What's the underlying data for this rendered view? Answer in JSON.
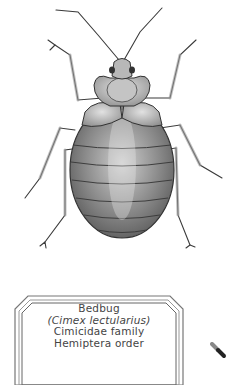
{
  "illustration": {
    "subject": "bedbug",
    "style": "graphite pencil scientific illustration",
    "colors": {
      "background": "#ffffff",
      "outline": "#333333",
      "shade_dark": "#6b6b6b",
      "shade_light": "#d9d9d9"
    }
  },
  "label": {
    "common_name": "Bedbug",
    "scientific_name": "(Cimex lectularius)",
    "family": "Cimicidae family",
    "order": "Hemiptera order"
  },
  "pin": {
    "icon": "pin-icon"
  }
}
